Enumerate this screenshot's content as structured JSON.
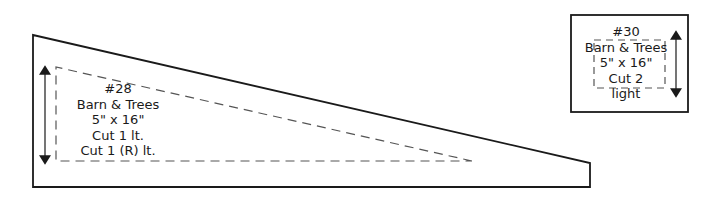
{
  "pieces": [
    {
      "id": "28",
      "lines": [
        "#28",
        "Barn & Trees",
        "5\" x 16\"",
        "Cut 1 lt.",
        "Cut 1 (R) lt."
      ]
    },
    {
      "id": "30",
      "lines": [
        "#30",
        "Barn & Trees",
        "5\" x 16\"",
        "Cut 2",
        "light"
      ]
    }
  ],
  "colors": {
    "stroke": "#1a1a1a",
    "dash": "#555555",
    "background": "#ffffff"
  }
}
